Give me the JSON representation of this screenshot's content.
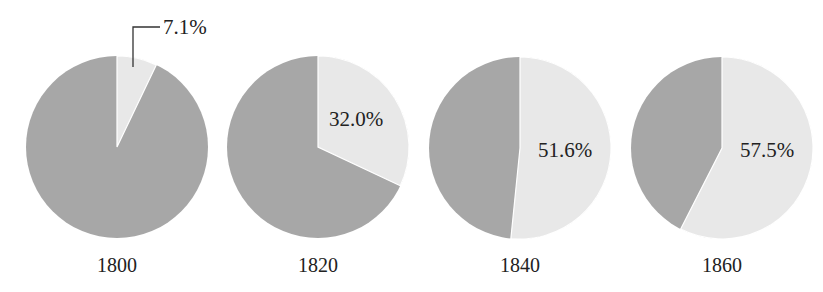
{
  "chart_data": {
    "type": "pie",
    "title": "",
    "colors": {
      "share": "#e8e8e8",
      "remainder": "#a7a7a7",
      "text": "#222222"
    },
    "pies": [
      {
        "label": "1800",
        "value": 7.1,
        "value_label": "7.1%",
        "callout": true
      },
      {
        "label": "1820",
        "value": 32.0,
        "value_label": "32.0%",
        "callout": false
      },
      {
        "label": "1840",
        "value": 51.6,
        "value_label": "51.6%",
        "callout": false
      },
      {
        "label": "1860",
        "value": 57.5,
        "value_label": "57.5%",
        "callout": false
      }
    ]
  }
}
